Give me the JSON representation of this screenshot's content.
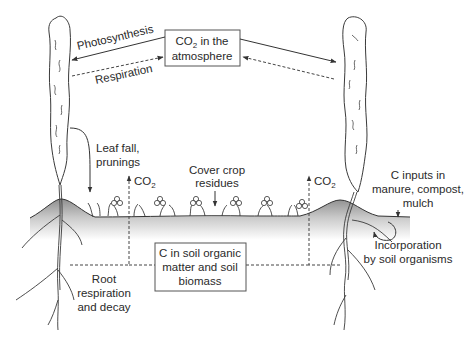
{
  "diagram": {
    "atmosphere_box": {
      "line1_prefix": "CO",
      "line1_sub": "2",
      "line1_suffix": " in the",
      "line2": "atmosphere"
    },
    "soil_box": {
      "line1": "C in soil organic",
      "line2": "matter and soil",
      "line3": "biomass"
    },
    "labels": {
      "photosynthesis": "Photosynthesis",
      "respiration": "Respiration",
      "leaf_fall_1": "Leaf fall,",
      "leaf_fall_2": "prunings",
      "cover_crop_1": "Cover crop",
      "cover_crop_2": "residues",
      "co2_left_prefix": "CO",
      "co2_left_sub": "2",
      "co2_right_prefix": "CO",
      "co2_right_sub": "2",
      "c_inputs_1": "C inputs in",
      "c_inputs_2": "manure, compost,",
      "c_inputs_3": "mulch",
      "incorporation_1": "Incorporation",
      "incorporation_2": "by soil organisms",
      "root_resp_1": "Root",
      "root_resp_2": "respiration",
      "root_resp_3": "and decay"
    },
    "colors": {
      "line": "#333333",
      "soil_top": "#9a9a9a",
      "soil_fade": "#ffffff",
      "text": "#2a2a2a"
    }
  }
}
